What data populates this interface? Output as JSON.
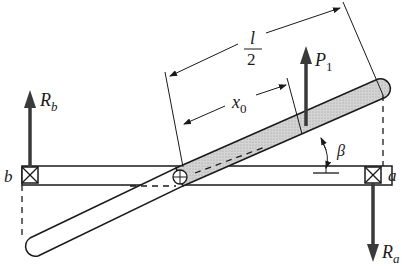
{
  "diagram": {
    "labels": {
      "half_length_numerator": "l",
      "half_length_denominator": "2",
      "offset": "x",
      "offset_sub": "0",
      "force": "P",
      "force_sub": "1",
      "angle": "β",
      "reaction_b": "R",
      "reaction_b_sub": "b",
      "reaction_a": "R",
      "reaction_a_sub": "a",
      "support_b": "b",
      "support_a": "a"
    },
    "colors": {
      "ink": "#1a1a1a",
      "arrow": "#3a3a3a",
      "shaded_rod": "#c8c8c8"
    }
  }
}
